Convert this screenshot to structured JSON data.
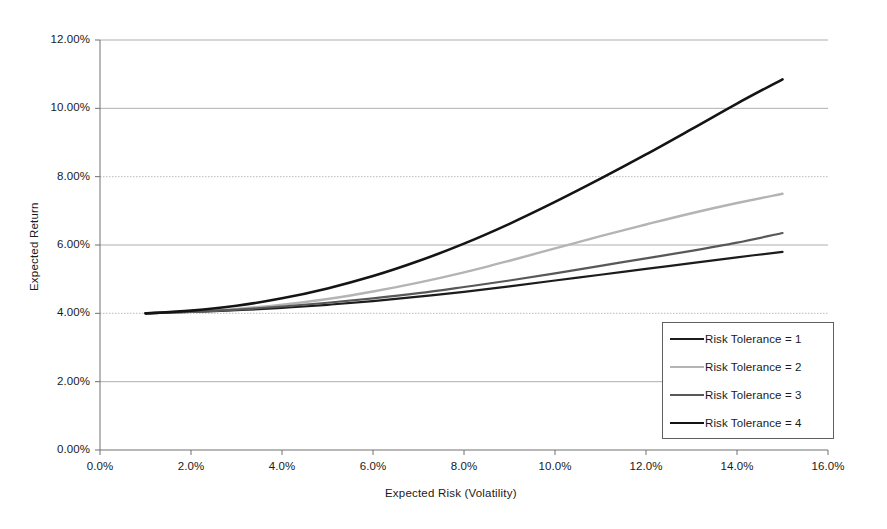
{
  "chart_data": {
    "type": "line",
    "title": "",
    "xlabel": "Expected Risk (Volatility)",
    "ylabel": "Expected Return",
    "xlim": [
      0.0,
      16.0
    ],
    "ylim": [
      0.0,
      12.0
    ],
    "xtick_labels": [
      "0.0%",
      "2.0%",
      "4.0%",
      "6.0%",
      "8.0%",
      "10.0%",
      "12.0%",
      "14.0%",
      "16.0%"
    ],
    "xticks": [
      0.0,
      2.0,
      4.0,
      6.0,
      8.0,
      10.0,
      12.0,
      14.0,
      16.0
    ],
    "ytick_labels": [
      "0.00%",
      "2.00%",
      "4.00%",
      "6.00%",
      "8.00%",
      "10.00%",
      "12.00%"
    ],
    "yticks": [
      0.0,
      2.0,
      4.0,
      6.0,
      8.0,
      10.0,
      12.0
    ],
    "grid": "horizontal",
    "legend_position": "lower-right",
    "series": [
      {
        "name": "Risk Tolerance = 1",
        "color": "#1c1c1c",
        "width": 2.2,
        "x": [
          1.0,
          2.0,
          3.0,
          4.0,
          5.0,
          6.0,
          7.0,
          8.0,
          9.0,
          10.0,
          11.0,
          12.0,
          13.0,
          14.0,
          15.0
        ],
        "y": [
          4.0,
          4.04,
          4.09,
          4.16,
          4.25,
          4.36,
          4.49,
          4.63,
          4.79,
          4.96,
          5.13,
          5.3,
          5.47,
          5.64,
          5.8
        ]
      },
      {
        "name": "Risk Tolerance = 2",
        "color": "#b4b4b4",
        "width": 2.4,
        "x": [
          1.0,
          2.0,
          3.0,
          4.0,
          5.0,
          6.0,
          7.0,
          8.0,
          9.0,
          10.0,
          11.0,
          12.0,
          13.0,
          14.0,
          15.0
        ],
        "y": [
          4.0,
          4.05,
          4.13,
          4.25,
          4.42,
          4.64,
          4.9,
          5.2,
          5.54,
          5.9,
          6.26,
          6.6,
          6.93,
          7.23,
          7.5
        ]
      },
      {
        "name": "Risk Tolerance = 3",
        "color": "#585858",
        "width": 2.2,
        "x": [
          1.0,
          2.0,
          3.0,
          4.0,
          5.0,
          6.0,
          7.0,
          8.0,
          9.0,
          10.0,
          11.0,
          12.0,
          13.0,
          14.0,
          15.0
        ],
        "y": [
          4.0,
          4.05,
          4.11,
          4.2,
          4.31,
          4.44,
          4.59,
          4.77,
          4.96,
          5.17,
          5.39,
          5.61,
          5.83,
          6.07,
          6.35
        ]
      },
      {
        "name": "Risk Tolerance = 4",
        "color": "#141414",
        "width": 2.6,
        "x": [
          1.0,
          2.0,
          3.0,
          4.0,
          5.0,
          6.0,
          7.0,
          8.0,
          9.0,
          10.0,
          11.0,
          12.0,
          13.0,
          14.0,
          15.0
        ],
        "y": [
          4.0,
          4.08,
          4.22,
          4.44,
          4.73,
          5.09,
          5.53,
          6.04,
          6.62,
          7.26,
          7.94,
          8.65,
          9.39,
          10.14,
          10.85
        ]
      }
    ]
  },
  "axis": {
    "y_label": "Expected Return",
    "x_label": "Expected Risk (Volatility)"
  },
  "legend": {
    "entries": [
      {
        "label": "Risk Tolerance = 1",
        "color": "#1c1c1c"
      },
      {
        "label": "Risk Tolerance = 2",
        "color": "#b4b4b4"
      },
      {
        "label": "Risk Tolerance = 3",
        "color": "#585858"
      },
      {
        "label": "Risk Tolerance = 4",
        "color": "#141414"
      }
    ]
  }
}
